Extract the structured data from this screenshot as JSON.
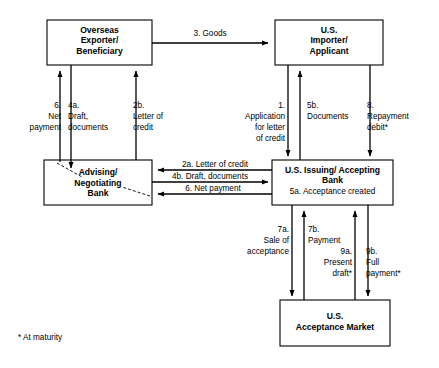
{
  "diagram": {
    "footnote": "* At maturity",
    "stroke_color": "#000000",
    "background_color": "#ffffff",
    "boxes": [
      {
        "id": "overseas-exporter",
        "lines": [
          "Overseas",
          "Exporter/",
          "Beneficiary"
        ],
        "sub": ""
      },
      {
        "id": "us-importer",
        "lines": [
          "U.S.",
          "Importer/",
          "Applicant"
        ],
        "sub": ""
      },
      {
        "id": "advising-bank",
        "lines": [
          "Advising/",
          "Negotiating",
          "Bank"
        ],
        "sub": ""
      },
      {
        "id": "issuing-bank",
        "lines": [
          "U.S. Issuing/ Accepting",
          "Bank"
        ],
        "sub": "5a. Acceptance created"
      },
      {
        "id": "acceptance-market",
        "lines": [
          "U.S.",
          "Acceptance Market"
        ],
        "sub": ""
      }
    ],
    "flow_labels": {
      "goods": "3. Goods",
      "net_payment_left": [
        "6.",
        "Net",
        "payment"
      ],
      "draft_documents_left": [
        "4a.",
        "Draft,",
        "documents"
      ],
      "letter_of_credit_left": [
        "2b.",
        "Letter of",
        "credit"
      ],
      "application_for_lc": [
        "1.",
        "Application",
        "for letter",
        "of credit"
      ],
      "documents_5b": [
        "5b.",
        "Documents"
      ],
      "repayment_debit": [
        "8.",
        "Repayment",
        "debit*"
      ],
      "letter_of_credit_2a": "2a. Letter of credit",
      "draft_documents_4b": "4b. Draft, documents",
      "net_payment_6": "6.   Net payment",
      "sale_of_acceptance": [
        "7a.",
        "Sale of",
        "acceptance"
      ],
      "payment_7b": [
        "7b.",
        "Payment"
      ],
      "present_draft": [
        "9a.",
        "Present",
        "draft*"
      ],
      "full_payment": [
        "9b.",
        "Full",
        "payment*"
      ]
    }
  }
}
